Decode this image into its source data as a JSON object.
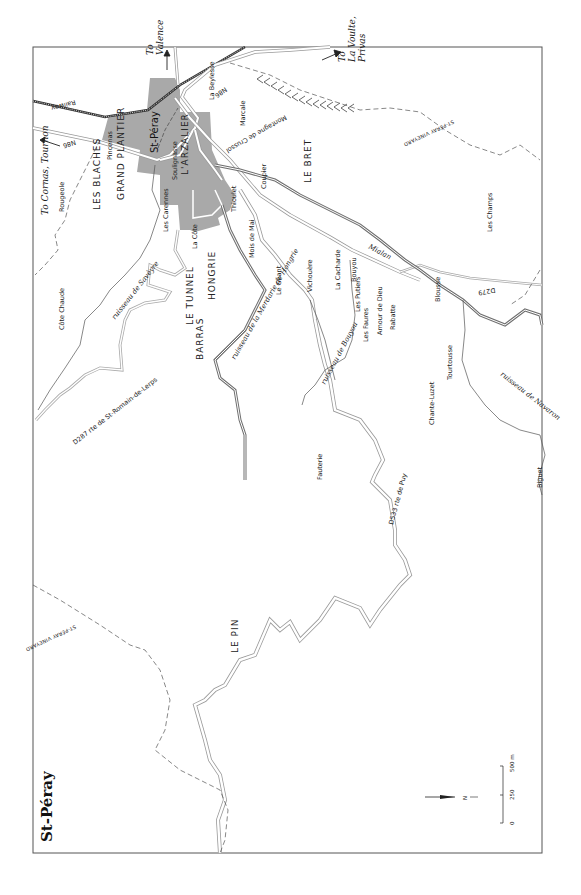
{
  "map": {
    "title": "St-Péray",
    "town_label": "St-Péray",
    "colors": {
      "background": "#ffffff",
      "frame": "#555555",
      "urban": "#a9a9a9",
      "road_outline": "#9a9a9a",
      "river": "#707070",
      "railway": "#333333",
      "vineyard_boundary": "#555555",
      "text": "#222222"
    },
    "area_labels": [
      {
        "text": "LES BLACHES",
        "x": 100,
        "y": 210
      },
      {
        "text": "GRAND PLANTIER",
        "x": 124,
        "y": 200
      },
      {
        "text": "L'ARZALIER",
        "x": 188,
        "y": 175
      },
      {
        "text": "LE TUNNEL",
        "x": 193,
        "y": 325
      },
      {
        "text": "BARRAS",
        "x": 203,
        "y": 360
      },
      {
        "text": "HONGRIE",
        "x": 215,
        "y": 300
      },
      {
        "text": "LE BRET",
        "x": 311,
        "y": 183
      },
      {
        "text": "LE PIN",
        "x": 238,
        "y": 653
      }
    ],
    "place_labels": [
      {
        "text": "Rougeole",
        "x": 64,
        "y": 212
      },
      {
        "text": "Pincenas",
        "x": 112,
        "y": 160
      },
      {
        "text": "Les Carennes",
        "x": 168,
        "y": 232
      },
      {
        "text": "Soulignasse",
        "x": 177,
        "y": 180
      },
      {
        "text": "La Côte",
        "x": 197,
        "y": 249
      },
      {
        "text": "Thioulet",
        "x": 236,
        "y": 212
      },
      {
        "text": "La Beylesse",
        "x": 214,
        "y": 100
      },
      {
        "text": "Marcale",
        "x": 245,
        "y": 126
      },
      {
        "text": "Coupier",
        "x": 266,
        "y": 189
      },
      {
        "text": "Mois de Mai",
        "x": 254,
        "y": 258
      },
      {
        "text": "Le Géant",
        "x": 281,
        "y": 295
      },
      {
        "text": "Vichouère",
        "x": 312,
        "y": 292
      },
      {
        "text": "La Cacharde",
        "x": 340,
        "y": 290
      },
      {
        "text": "Bouyou",
        "x": 356,
        "y": 282
      },
      {
        "text": "Les Putiers",
        "x": 360,
        "y": 312
      },
      {
        "text": "Les Faures",
        "x": 368,
        "y": 342
      },
      {
        "text": "Amour de Dieu",
        "x": 382,
        "y": 335
      },
      {
        "text": "Rabatte",
        "x": 395,
        "y": 330
      },
      {
        "text": "Blousse",
        "x": 440,
        "y": 302
      },
      {
        "text": "Tourtousse",
        "x": 452,
        "y": 380
      },
      {
        "text": "Chante-Luzet",
        "x": 434,
        "y": 425
      },
      {
        "text": "Les Champs",
        "x": 492,
        "y": 232
      },
      {
        "text": "Côte Chaude",
        "x": 64,
        "y": 330
      },
      {
        "text": "Fauterie",
        "x": 322,
        "y": 480
      },
      {
        "text": "Biguet",
        "x": 542,
        "y": 488
      }
    ],
    "stream_labels": [
      {
        "text": "ruisseau de Savèyre",
        "x": 115,
        "y": 320,
        "angle": -52
      },
      {
        "text": "ruisseau de la Merdarie de Hongrie",
        "x": 235,
        "y": 360,
        "angle": -60
      },
      {
        "text": "ruisseau de Bouyou",
        "x": 325,
        "y": 385,
        "angle": -62
      },
      {
        "text": "ruisseau de Navaron",
        "x": 500,
        "y": 375,
        "angle": 38
      },
      {
        "text": "Mialan",
        "x": 368,
        "y": 248,
        "angle": 28
      }
    ],
    "road_labels": [
      {
        "text": "N86",
        "x": 75,
        "y": 140,
        "angle": 163
      },
      {
        "text": "N86",
        "x": 225,
        "y": 87,
        "angle": 145
      },
      {
        "text": "D287 rte de St-Romain-de-Lerps",
        "x": 75,
        "y": 445,
        "angle": -38
      },
      {
        "text": "D533 rte de Puy",
        "x": 393,
        "y": 525,
        "angle": -75
      },
      {
        "text": "D279",
        "x": 495,
        "y": 288,
        "angle": 170
      },
      {
        "text": "Railway",
        "x": 75,
        "y": 100,
        "angle": 165
      },
      {
        "text": "Montagne de Crussol",
        "x": 285,
        "y": 115,
        "angle": 150
      },
      {
        "text": "ST-PÉRAY VINEYARD",
        "x": 453,
        "y": 120,
        "angle": 155
      },
      {
        "text": "ST-PÉRAY VINEYARD",
        "x": 75,
        "y": 625,
        "angle": 155
      }
    ],
    "destinations": [
      {
        "text": "To Valence",
        "line1": "To",
        "line2": "Valence",
        "x": 153,
        "y": 55
      },
      {
        "text": "To Cornas, Tournon",
        "line1": "To Cornas, Tournon",
        "x": 48,
        "y": 215
      },
      {
        "text": "To La Voulte, Privas",
        "line1": "To",
        "line2": "La Voulte,",
        "line3": "Privas",
        "x": 345,
        "y": 62
      }
    ],
    "north_arrow": {
      "label": "N"
    },
    "scale_bar": {
      "ticks": [
        "0",
        "250",
        "500 m"
      ]
    }
  }
}
